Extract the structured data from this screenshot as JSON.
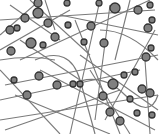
{
  "image": {
    "description": "Grayscale network illustration of circular nodes connected by thin gray lines",
    "width": 160,
    "height": 134,
    "background": "#ffffff",
    "line_color": "#7a7a7a",
    "node_stroke": "#333333",
    "node_fill": "#808080"
  },
  "lines": [
    [
      0,
      35,
      40,
      0
    ],
    [
      10,
      5,
      60,
      40
    ],
    [
      0,
      20,
      155,
      10
    ],
    [
      20,
      60,
      150,
      0
    ],
    [
      30,
      0,
      90,
      55
    ],
    [
      45,
      0,
      55,
      30
    ],
    [
      0,
      50,
      70,
      10
    ],
    [
      5,
      85,
      158,
      55
    ],
    [
      0,
      100,
      140,
      70
    ],
    [
      0,
      120,
      158,
      95
    ],
    [
      5,
      130,
      120,
      90
    ],
    [
      60,
      15,
      158,
      35
    ],
    [
      75,
      20,
      120,
      134
    ],
    [
      100,
      0,
      70,
      134
    ],
    [
      110,
      5,
      95,
      120
    ],
    [
      130,
      0,
      115,
      60
    ],
    [
      155,
      30,
      105,
      120
    ],
    [
      80,
      55,
      158,
      110
    ],
    [
      40,
      70,
      155,
      130
    ],
    [
      0,
      70,
      60,
      134
    ],
    [
      15,
      95,
      110,
      134
    ],
    [
      90,
      70,
      130,
      134
    ],
    [
      145,
      60,
      150,
      134
    ],
    [
      20,
      40,
      80,
      80
    ]
  ],
  "curves": [
    "M35 60 Q70 45 80 80 T95 134",
    "M70 85 Q100 70 125 95 T158 95",
    "M0 60 Q30 55 55 60",
    "M100 30 Q130 30 158 60"
  ],
  "nodes": [
    [
      38,
      3,
      4
    ],
    [
      67,
      3,
      3
    ],
    [
      99,
      3,
      3
    ],
    [
      115,
      8,
      5
    ],
    [
      138,
      10,
      4
    ],
    [
      150,
      5,
      3
    ],
    [
      17,
      28,
      3
    ],
    [
      25,
      18,
      4
    ],
    [
      48,
      23,
      4
    ],
    [
      38,
      13,
      5
    ],
    [
      152,
      20,
      3
    ],
    [
      10,
      30,
      4
    ],
    [
      68,
      25,
      3
    ],
    [
      91,
      26,
      4
    ],
    [
      148,
      28,
      4
    ],
    [
      11,
      51,
      4
    ],
    [
      31,
      43,
      5
    ],
    [
      43,
      45,
      3
    ],
    [
      55,
      37,
      4
    ],
    [
      84,
      42,
      3
    ],
    [
      104,
      43,
      4
    ],
    [
      14,
      80,
      3
    ],
    [
      39,
      76,
      4
    ],
    [
      57,
      85,
      4
    ],
    [
      73,
      84,
      3
    ],
    [
      80,
      84,
      3
    ],
    [
      113,
      84,
      5
    ],
    [
      27,
      95,
      4
    ],
    [
      103,
      96,
      4
    ],
    [
      124,
      75,
      3
    ],
    [
      135,
      72,
      3
    ],
    [
      146,
      57,
      4
    ],
    [
      151,
      48,
      3
    ],
    [
      142,
      89,
      4
    ],
    [
      130,
      99,
      3
    ],
    [
      110,
      112,
      4
    ],
    [
      150,
      93,
      4
    ],
    [
      120,
      121,
      4
    ],
    [
      137,
      113,
      3
    ],
    [
      152,
      115,
      3
    ]
  ]
}
